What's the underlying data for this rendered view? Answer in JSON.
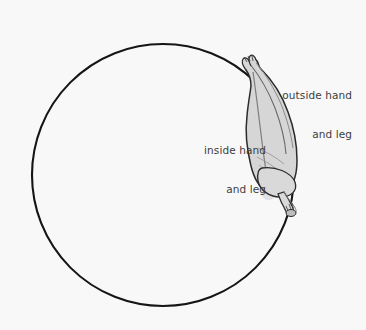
{
  "figure": {
    "background_color": "#f8f8f8",
    "circle_color": "#151515",
    "body_fill_color": "#d4d4d4",
    "body_outline_color": "#2b2b2b",
    "label_color": "#3d3d3d"
  },
  "annotations": {
    "outside": {
      "line1": "outside hand",
      "line2": "and leg",
      "full_text": "outside hand and leg"
    },
    "inside": {
      "line1": "inside hand",
      "line2": "and leg",
      "full_text": "inside hand and leg"
    }
  },
  "geometry": {
    "circle_center_x": 163,
    "circle_center_y": 175,
    "circle_radius": 131,
    "circle_stroke_width": 2
  }
}
